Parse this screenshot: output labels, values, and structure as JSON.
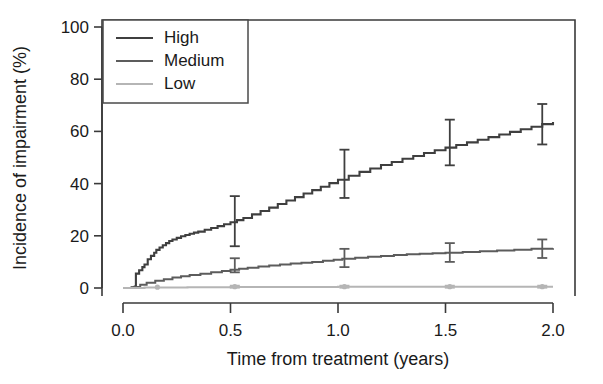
{
  "chart_data": {
    "type": "line",
    "title": "",
    "subtitle": "",
    "xlabel": "Time from treatment (years)",
    "ylabel": "Incidence of impairment (%)",
    "xlim": [
      -0.06,
      2.12
    ],
    "ylim": [
      -4,
      104
    ],
    "xticks": [
      0.0,
      0.5,
      1.0,
      1.5,
      2.0
    ],
    "xticklabels": [
      "0.0",
      "0.5",
      "1.0",
      "1.5",
      "2.0"
    ],
    "yticks": [
      0,
      20,
      40,
      60,
      80,
      100
    ],
    "yticklabels": [
      "0",
      "20",
      "40",
      "60",
      "80",
      "100"
    ],
    "grid": false,
    "legend_position": "top-left-inside",
    "step_style": "hv",
    "series": [
      {
        "name": "High",
        "color": "#3f3f3f",
        "linewidth": 2.1,
        "x": [
          0.0,
          0.04,
          0.055,
          0.06,
          0.075,
          0.09,
          0.1,
          0.115,
          0.13,
          0.145,
          0.155,
          0.17,
          0.185,
          0.2,
          0.215,
          0.23,
          0.25,
          0.27,
          0.29,
          0.31,
          0.33,
          0.35,
          0.38,
          0.41,
          0.44,
          0.47,
          0.5,
          0.53,
          0.56,
          0.6,
          0.64,
          0.68,
          0.72,
          0.76,
          0.8,
          0.84,
          0.88,
          0.92,
          0.96,
          1.0,
          1.05,
          1.1,
          1.15,
          1.2,
          1.25,
          1.3,
          1.35,
          1.4,
          1.45,
          1.5,
          1.55,
          1.6,
          1.65,
          1.7,
          1.75,
          1.8,
          1.85,
          1.9,
          1.95,
          2.0
        ],
        "y": [
          0.0,
          0.3,
          0.6,
          5.5,
          6.8,
          8.0,
          9.0,
          11.0,
          12.3,
          13.5,
          14.6,
          15.5,
          16.4,
          17.2,
          18.0,
          18.6,
          19.2,
          19.8,
          20.3,
          20.8,
          21.2,
          21.6,
          22.3,
          23.0,
          23.7,
          24.4,
          25.2,
          26.0,
          26.8,
          28.2,
          29.5,
          30.8,
          32.2,
          33.5,
          34.8,
          36.2,
          37.5,
          38.8,
          40.2,
          41.5,
          43.0,
          44.5,
          45.8,
          47.1,
          48.3,
          49.5,
          50.6,
          51.7,
          52.8,
          53.8,
          54.8,
          55.8,
          56.8,
          57.8,
          58.8,
          59.8,
          60.8,
          61.8,
          62.8,
          63.6
        ],
        "errorbars": [
          {
            "x": 0.52,
            "y": 25.5,
            "lower": 16.0,
            "upper": 35.2
          },
          {
            "x": 1.03,
            "y": 43.5,
            "lower": 34.5,
            "upper": 53.0
          },
          {
            "x": 1.52,
            "y": 55.0,
            "lower": 47.0,
            "upper": 64.5
          },
          {
            "x": 1.95,
            "y": 62.5,
            "lower": 55.0,
            "upper": 70.5
          }
        ]
      },
      {
        "name": "Medium",
        "color": "#5c5c5c",
        "linewidth": 2.0,
        "x": [
          0.0,
          0.05,
          0.08,
          0.11,
          0.15,
          0.19,
          0.23,
          0.27,
          0.31,
          0.36,
          0.41,
          0.46,
          0.5,
          0.54,
          0.58,
          0.63,
          0.68,
          0.73,
          0.78,
          0.83,
          0.88,
          0.93,
          0.98,
          1.02,
          1.08,
          1.14,
          1.2,
          1.26,
          1.32,
          1.38,
          1.44,
          1.5,
          1.58,
          1.66,
          1.74,
          1.82,
          1.9,
          2.0
        ],
        "y": [
          0.0,
          0.4,
          1.2,
          2.0,
          2.8,
          3.4,
          4.0,
          4.5,
          5.0,
          5.5,
          6.0,
          6.5,
          7.0,
          7.4,
          7.8,
          8.2,
          8.6,
          9.0,
          9.4,
          9.7,
          10.0,
          10.4,
          10.8,
          11.2,
          11.6,
          12.0,
          12.3,
          12.6,
          12.9,
          13.1,
          13.3,
          13.5,
          13.8,
          14.1,
          14.4,
          14.7,
          15.0,
          15.2
        ],
        "errorbars": [
          {
            "x": 0.52,
            "y": 8.6,
            "lower": 6.0,
            "upper": 11.4
          },
          {
            "x": 1.03,
            "y": 11.4,
            "lower": 8.0,
            "upper": 15.0
          },
          {
            "x": 1.52,
            "y": 13.6,
            "lower": 10.0,
            "upper": 17.2
          },
          {
            "x": 1.95,
            "y": 15.0,
            "lower": 11.5,
            "upper": 18.6
          }
        ]
      },
      {
        "name": "Low",
        "color": "#b5b5b5",
        "linewidth": 2.0,
        "x": [
          0.0,
          0.1,
          0.3,
          0.5,
          0.75,
          1.0,
          1.25,
          1.5,
          1.75,
          2.0
        ],
        "y": [
          0.0,
          0.2,
          0.3,
          0.4,
          0.4,
          0.5,
          0.5,
          0.5,
          0.5,
          0.5
        ],
        "errorbars": [
          {
            "x": 0.52,
            "y": 0.5,
            "lower": 0.1,
            "upper": 0.9
          },
          {
            "x": 1.03,
            "y": 0.5,
            "lower": 0.1,
            "upper": 0.9
          },
          {
            "x": 1.52,
            "y": 0.5,
            "lower": 0.1,
            "upper": 0.9
          },
          {
            "x": 1.95,
            "y": 0.5,
            "lower": 0.1,
            "upper": 0.9
          }
        ],
        "markers": [
          {
            "x": 0.16,
            "y": 0.3
          },
          {
            "x": 0.52,
            "y": 0.5
          },
          {
            "x": 1.03,
            "y": 0.5
          },
          {
            "x": 1.52,
            "y": 0.5
          },
          {
            "x": 1.95,
            "y": 0.5
          }
        ]
      }
    ],
    "legend": [
      {
        "label": "High",
        "color": "#3f3f3f"
      },
      {
        "label": "Medium",
        "color": "#5c5c5c"
      },
      {
        "label": "Low",
        "color": "#b5b5b5"
      }
    ]
  },
  "colors": {
    "axis": "#3a3a3a",
    "text": "#1a1a1a",
    "background": "#ffffff",
    "high": "#3f3f3f",
    "medium": "#5c5c5c",
    "low": "#b5b5b5"
  }
}
